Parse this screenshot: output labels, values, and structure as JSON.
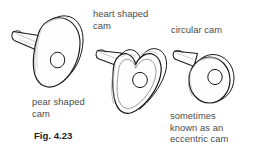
{
  "figure": {
    "caption": "Fig. 4.23",
    "background_color": "#ffffff",
    "line_color": "#1a1a1a",
    "label_color": "#4b4b4b",
    "caption_color": "#1e1e1e"
  },
  "labels": {
    "heart_cam": "heart shaped\ncam",
    "circular_cam": "circular cam",
    "pear_cam": "pear shaped\ncam",
    "eccentric_note": "sometimes\nknown as an\neccentric cam"
  },
  "cams": [
    {
      "id": "pear-cam",
      "name": "pear shaped cam",
      "shape": "pear",
      "has_shaft": true,
      "has_center_hole": true
    },
    {
      "id": "heart-cam",
      "name": "heart shaped cam",
      "shape": "heart",
      "has_shaft": true,
      "has_center_hole": true
    },
    {
      "id": "circular-cam",
      "name": "circular cam",
      "shape": "circle",
      "has_shaft": true,
      "has_center_hole": true
    }
  ]
}
